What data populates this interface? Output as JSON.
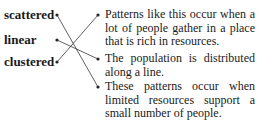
{
  "terms": [
    {
      "label": "scattered"
    },
    {
      "label": "linear"
    },
    {
      "label": "clustered"
    }
  ],
  "descriptions": [
    {
      "text": "Patterns like this occur when a lot of people gather in a place that is rich in resources."
    },
    {
      "text": "The population is distributed along a line."
    },
    {
      "text": "These patterns occur when limited resources support a small number of people."
    }
  ],
  "matches": [
    {
      "term": "scattered",
      "description_index": 2
    },
    {
      "term": "linear",
      "description_index": 1
    },
    {
      "term": "clustered",
      "description_index": 0
    }
  ],
  "colors": {
    "line": "#3a3a3a",
    "text": "#1a1a1a"
  }
}
